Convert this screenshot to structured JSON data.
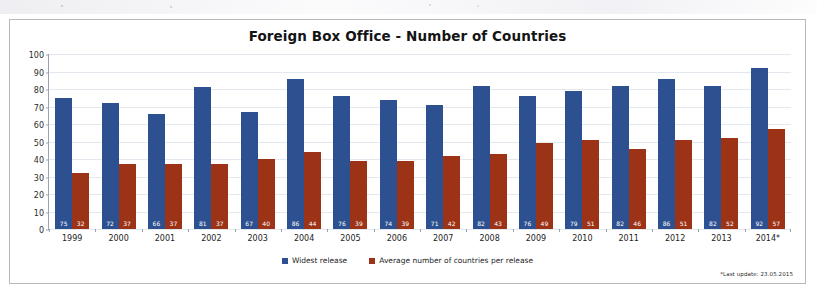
{
  "chart_data": {
    "type": "bar",
    "title": "Foreign Box Office - Number of Countries",
    "xlabel": "",
    "ylabel": "",
    "ylim": [
      0,
      100
    ],
    "ytick_step": 10,
    "yticks": [
      100,
      90,
      80,
      70,
      60,
      50,
      40,
      30,
      20,
      10,
      0
    ],
    "grid": true,
    "legend_position": "bottom-center",
    "categories": [
      "1999",
      "2000",
      "2001",
      "2002",
      "2003",
      "2004",
      "2005",
      "2006",
      "2007",
      "2008",
      "2009",
      "2010",
      "2011",
      "2012",
      "2013",
      "2014*"
    ],
    "series": [
      {
        "name": "Widest release",
        "color": "#2d5190",
        "values": [
          75,
          72,
          66,
          81,
          67,
          86,
          76,
          74,
          71,
          82,
          76,
          79,
          82,
          86,
          82,
          92
        ]
      },
      {
        "name": "Average number of countries per release",
        "color": "#9c3317",
        "values": [
          32,
          37,
          37,
          37,
          40,
          44,
          39,
          39,
          42,
          43,
          49,
          51,
          46,
          51,
          52,
          57
        ]
      }
    ],
    "annotations": [
      "*Last update: 23.05.2015"
    ]
  },
  "chart": {
    "title": "Foreign Box Office - Number of Countries",
    "footnote": "*Last update: 23.05.2015"
  },
  "legend": {
    "items": [
      {
        "label": "Widest release",
        "color": "#2d5190"
      },
      {
        "label": "Average number of countries per release",
        "color": "#9c3317"
      }
    ]
  },
  "colors": {
    "blue": "#2d5190",
    "red": "#9c3317",
    "grid": "#e3e7ee",
    "axis": "#9aa3b0",
    "frame": "#b9b9bd"
  }
}
